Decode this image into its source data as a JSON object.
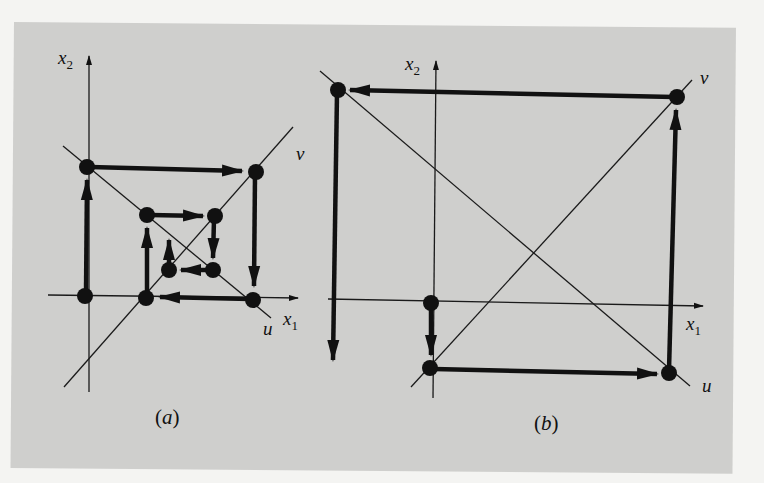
{
  "figure": {
    "panels": [
      {
        "id": "a",
        "caption": "(a)",
        "caption_letter": "a",
        "axes": {
          "x_label": "x",
          "x_sub": "1",
          "y_label": "x",
          "y_sub": "2"
        },
        "lines": {
          "u_label": "u",
          "v_label": "v"
        },
        "description": "Converging inward spiral of iterates around the origin"
      },
      {
        "id": "b",
        "caption": "(b)",
        "caption_letter": "b",
        "axes": {
          "x_label": "x",
          "x_sub": "1",
          "y_label": "x",
          "y_sub": "2"
        },
        "lines": {
          "u_label": "u",
          "v_label": "v"
        },
        "description": "Diverging outward spiral of iterates"
      }
    ],
    "colors": {
      "background": "#cfcfcd",
      "ink": "#111111",
      "page": "#f4f4f2"
    }
  }
}
